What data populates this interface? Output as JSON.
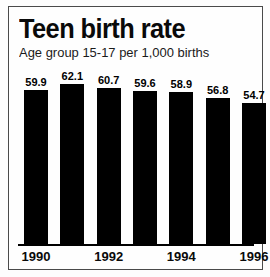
{
  "chart_data": {
    "type": "bar",
    "title": "Teen birth rate",
    "subtitle": "Age group 15-17 per 1,000 births",
    "xlabel": "",
    "ylabel": "",
    "categories": [
      "1990",
      "1991",
      "1992",
      "1993",
      "1994",
      "1995",
      "1996"
    ],
    "values": [
      59.9,
      62.1,
      60.7,
      59.6,
      58.9,
      56.8,
      54.7
    ],
    "value_labels": [
      "59.9",
      "62.1",
      "60.7",
      "59.6",
      "58.9",
      "56.8",
      "54.7"
    ],
    "tick_labels": [
      "1990",
      "",
      "1992",
      "",
      "1994",
      "",
      "1996"
    ],
    "ylim": [
      0,
      66
    ],
    "grid": false,
    "legend": null,
    "bar_color": "#000000",
    "background_color": "#fefefe",
    "axis_color": "#000000"
  }
}
